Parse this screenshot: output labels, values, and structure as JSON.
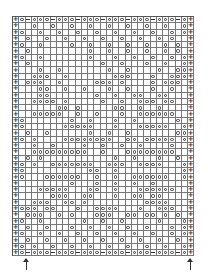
{
  "chart": {
    "columns": 29,
    "rows_count": 38,
    "legend_symbols": {
      "+": "plus-symbol",
      "o": "yarn-over-circle",
      "-": "dash-symbol",
      ".": "empty"
    },
    "rows": [
      "+o-ooo-ooo-ooo-ooo-ooo-ooo-o+",
      "+..o..o..o..o..o..o..o..o..o+",
      "+o..o..o..o..o..o..o..o..o.o+",
      "+.o..o..o..o..o..o..o..o.o..+",
      "+o..o....o..o..o..o..o..o.o.+",
      "+.o.........o..o..o..o..o.o.+",
      "+o..o.......o...o..o..o..o.o+",
      "+.o...........o..o...o..o..o+",
      "+...o..o.......o..o....o..oo+",
      "+..ooo..o.......ooo...o..ooo+",
      "+.ooo..o.....ooo.o....o.ooo.+",
      "+...oo..o..o...o..o...o..o..+",
      "+...oo.......o..o..oo..oo...+",
      "+..oooo.o.....o..o..ooo.oo..+",
      "+......oo.o.....oo..o..o....+",
      "+..ooooo..o..o...o..oooooo..+",
      "+o.......o..o...o..o......o.+",
      "+o......ooooo...o...ooooo..o+",
      "+.o..o......o..o..o.......oo+",
      "+o.o....oooooooo..oo.ooooo.o+",
      "+..o..o....o..o..o..o....o..+",
      "+..ooooooooo..o...oooooooo..+",
      "+.o.o...........o..o...o..o.+",
      "+o.o..ooooooo..ooo..oooo...o+",
      "+o..........oo..o..........o+",
      "+o...oooooo..o..o..oooooo..o+",
      "+........o...o..o..o..o.....+",
      "+...ooooo...oo..o...oooooo..+",
      "+.....ooo..oo...o..oo.oo....+",
      "+..ooo..oo.o.........oooo...+",
      "+ooo.oo...o..oooo...o..ooo..+",
      "+.ooo..o.o...ooo..oo.oo.o.o.+",
      "+o..o......o..o..o.....o...o+",
      "+.o..o...o..o..o..o..o...o.o+",
      "+o..o..o..o..o..o..o..o..o.o+",
      "+.o..o..o..o..o..o..o..o..o.+",
      "+o.o..o..o..o..o..o..o..o..o+",
      "+o-ooo-ooo-ooo-ooo-ooo-ooo-o+"
    ]
  },
  "arrows": [
    {
      "name": "start-arrow-left",
      "x": 22,
      "direction": "up"
    },
    {
      "name": "start-arrow-right",
      "x": 186,
      "direction": "up"
    }
  ]
}
